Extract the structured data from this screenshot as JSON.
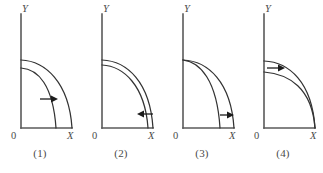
{
  "figure": {
    "background_color": "#ffffff",
    "line_color": "#333333",
    "axis_color": "#5a5a5a",
    "arrow_color": "#1c1c1c",
    "panel_count": 4
  },
  "panels": [
    {
      "caption": "(1)",
      "y_axis_label": "Y",
      "x_axis_label": "X",
      "origin_label": "0",
      "curves": [
        {
          "name": "inner-arc",
          "y_intercept": 60,
          "x_intercept": 35
        },
        {
          "name": "outer-arc",
          "y_intercept": 42,
          "x_intercept": 51
        }
      ],
      "arrow": {
        "direction": "right",
        "meaning": "outward-shift"
      }
    },
    {
      "caption": "(2)",
      "y_axis_label": "Y",
      "x_axis_label": "X",
      "origin_label": "0",
      "curves": [
        {
          "name": "inner-arc",
          "y_intercept": 48,
          "x_intercept": 44
        },
        {
          "name": "outer-arc",
          "y_intercept": 42,
          "x_intercept": 51
        }
      ],
      "arrow": {
        "direction": "left",
        "meaning": "inward-shift"
      }
    },
    {
      "caption": "(3)",
      "y_axis_label": "Y",
      "x_axis_label": "X",
      "origin_label": "0",
      "curves": [
        {
          "name": "steep-arc",
          "y_intercept": 42,
          "x_intercept": 38
        },
        {
          "name": "wide-arc",
          "y_intercept": 42,
          "x_intercept": 51
        }
      ],
      "arrow": {
        "direction": "right",
        "meaning": "x-intercept-shift"
      }
    },
    {
      "caption": "(4)",
      "y_axis_label": "Y",
      "x_axis_label": "X",
      "origin_label": "0",
      "curves": [
        {
          "name": "low-arc",
          "y_intercept": 52,
          "x_intercept": 51
        },
        {
          "name": "high-arc",
          "y_intercept": 42,
          "x_intercept": 51
        }
      ],
      "arrow": {
        "direction": "right",
        "meaning": "y-intercept-shift"
      }
    }
  ]
}
